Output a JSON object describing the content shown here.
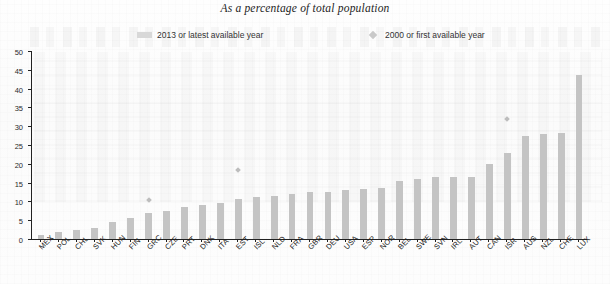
{
  "chart_data": {
    "type": "bar",
    "title": "As a percentage of total population",
    "xlabel": "",
    "ylabel": "",
    "ylim": [
      0,
      50
    ],
    "ytick_step": 5,
    "yticks": [
      0,
      5,
      10,
      15,
      20,
      25,
      30,
      35,
      40,
      45,
      50
    ],
    "grid": false,
    "legend_position": "top",
    "categories": [
      "MEX",
      "POL",
      "CHL",
      "SVK",
      "HUN",
      "FIN",
      "GRC",
      "CZE",
      "PRT",
      "DNK",
      "ITA",
      "EST",
      "ISL",
      "NLD",
      "FRA",
      "GBR",
      "DEU",
      "USA",
      "ESP",
      "NOR",
      "BEL",
      "SWE",
      "SVN",
      "IRL",
      "AUT",
      "CAN",
      "ISR",
      "AUS",
      "NZL",
      "CHE",
      "LUX"
    ],
    "series": [
      {
        "name": "2013 or latest available year",
        "type": "bar",
        "color": "#c4c4c4",
        "values": [
          1.0,
          1.9,
          2.4,
          3.0,
          4.5,
          5.6,
          7.0,
          7.5,
          8.4,
          9.0,
          9.5,
          10.6,
          11.1,
          11.5,
          12.0,
          12.4,
          12.6,
          13.1,
          13.4,
          13.5,
          15.5,
          16.0,
          16.4,
          16.5,
          16.6,
          20.0,
          22.9,
          27.4,
          28.0,
          28.3,
          43.5
        ]
      },
      {
        "name": "2000 or first available year",
        "type": "scatter",
        "color": "#bdbdbd",
        "marker": "diamond",
        "values": [
          null,
          null,
          null,
          null,
          null,
          null,
          10.4,
          null,
          null,
          null,
          null,
          18.4,
          null,
          null,
          null,
          null,
          null,
          null,
          null,
          null,
          null,
          null,
          null,
          null,
          null,
          null,
          31.8,
          null,
          null,
          null,
          null
        ]
      }
    ]
  },
  "legend": {
    "items": [
      {
        "label": "2013 or latest available year",
        "swatch": "bar-swatch"
      },
      {
        "label": "2000 or first available year",
        "swatch": "diamond-swatch"
      }
    ]
  }
}
